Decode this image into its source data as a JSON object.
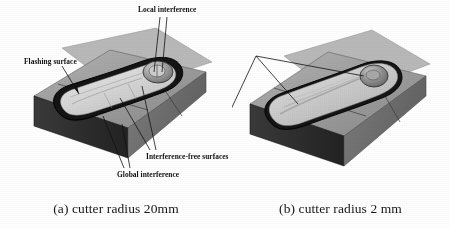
{
  "figure": {
    "background_color": "#ffffff",
    "ink_color": "#111111"
  },
  "panel_a": {
    "caption": "(a) cutter radius 20mm",
    "annotations": {
      "local_interference": "Local interference",
      "flashing_surface": "Flashing surface",
      "interference_free_surfaces": "Interference-free surfaces",
      "global_interference": "Global interference"
    },
    "colors": {
      "block_top": "#9b9b9b",
      "block_front": "#2e2e2e",
      "block_side": "#6f6f6f",
      "pocket_rim": "#141414",
      "pocket_floor": "#d9d9d9",
      "boss": "#8a8a8a"
    }
  },
  "panel_b": {
    "caption": "(b) cutter radius 2 mm",
    "annotations": {
      "interference_regions": "Interference regions"
    },
    "colors": {
      "block_top": "#9b9b9b",
      "block_front": "#2e2e2e",
      "block_side": "#6f6f6f",
      "pocket_rim": "#141414",
      "pocket_floor": "#d5d5d5",
      "boss": "#8a8a8a"
    }
  }
}
